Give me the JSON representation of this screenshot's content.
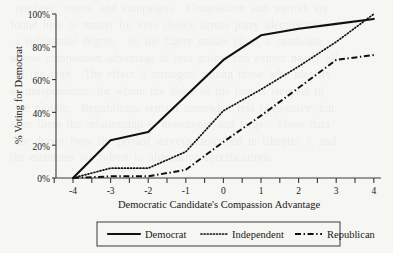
{
  "chart_data": {
    "type": "line",
    "title": "",
    "xlabel": "Democratic Candidate's Compassion Advantage",
    "ylabel": "% Voting for Democrat",
    "xlim": [
      -4,
      4
    ],
    "ylim": [
      0,
      100
    ],
    "grid": false,
    "legend_position": "bottom",
    "x": [
      -4,
      -3,
      -2,
      -1,
      0,
      1,
      2,
      3,
      4
    ],
    "xticks": [
      "-4",
      "-3",
      "-2",
      "-1",
      "0",
      "1",
      "2",
      "3",
      "4"
    ],
    "yticks": [
      "0%",
      "20%",
      "40%",
      "60%",
      "80%",
      "100%"
    ],
    "ytick_values": [
      0,
      20,
      40,
      60,
      80,
      100
    ],
    "minor_ticks": true,
    "series": [
      {
        "name": "Democrat",
        "style": "solid",
        "values": [
          0,
          23,
          28,
          50,
          72,
          87,
          91,
          94,
          97
        ]
      },
      {
        "name": "Independent",
        "style": "dotted",
        "values": [
          0,
          6,
          6,
          16,
          41,
          54,
          68,
          83,
          100
        ]
      },
      {
        "name": "Republican",
        "style": "dash-dot",
        "values": [
          0,
          1,
          1,
          5,
          22,
          38,
          55,
          72,
          75
        ]
      }
    ]
  },
  "legend": {
    "entries": [
      {
        "label": "Democrat",
        "style": "solid"
      },
      {
        "label": "Independent",
        "style": "dotted"
      },
      {
        "label": "Republican",
        "style": "dash-dot"
      }
    ]
  },
  "colors": {
    "background": "#f6f6f3",
    "ink": "#111111",
    "axis": "#3a3a3a"
  },
  "bleed_through": {
    "text": "   teachers, voters, and campaigns.  Compassion and warmth are\n  found here to matter for vote choice across party identification\n   a substantial degree.  As the figure makes plain, a candidate\n  whose compassion advantage is four points can expect nearly all\n   of the vote.  The effect is strongest among those who identify\n  as independents, for whom the slope of the line is steepest in\n   the middle.  Republicans remain somewhat less responsive, but\n  even there the relationship is monotonic and large.  These data\n   are drawn from the pooled surveys described in Chapter 3, and\n  the estimates are robust to alternative specifications.\n\n\n\n\n\n  The figure below reports predicted probabilities with all other\n  covariates held at their sample means."
  }
}
